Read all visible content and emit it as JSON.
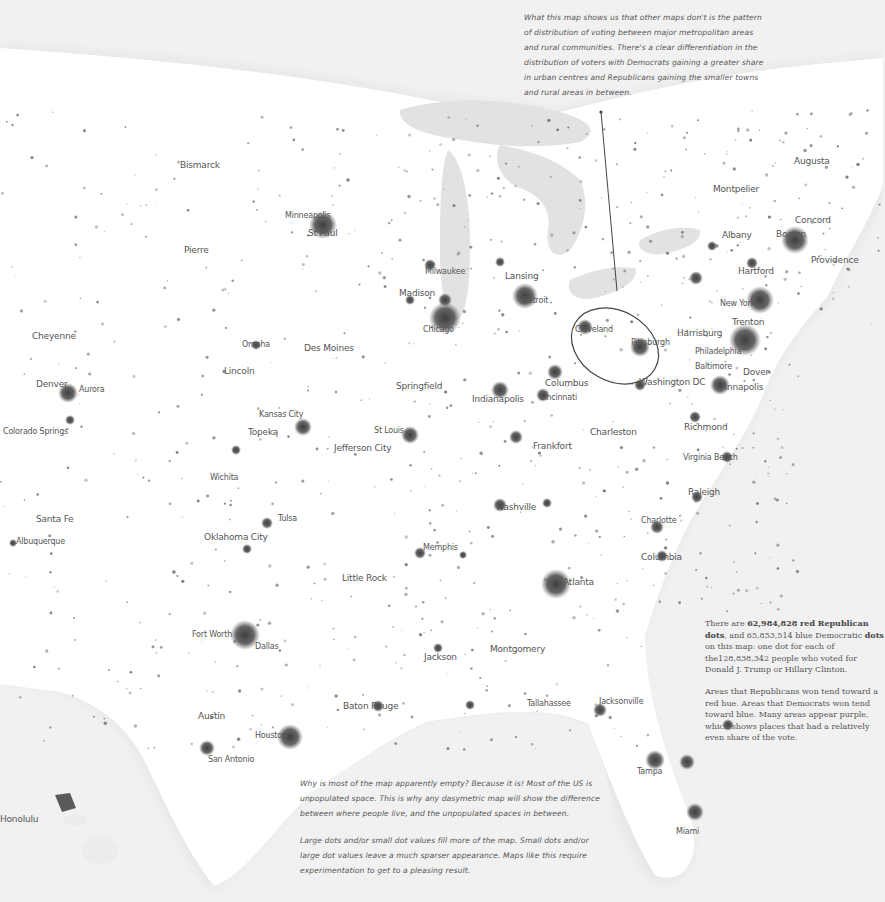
{
  "map": {
    "title": "US 2016 presidential election dot-density map",
    "colors": {
      "background": "#f1f1f1",
      "land": "#ffffff",
      "water": "#e2e2e2",
      "dots": "#4a4a4a",
      "text": "#555555"
    },
    "cities": [
      {
        "name": "Bismarck",
        "x": 180,
        "y": 160,
        "size": "m"
      },
      {
        "name": "Pierre",
        "x": 184,
        "y": 245,
        "size": "m"
      },
      {
        "name": "Minneapolis",
        "x": 285,
        "y": 211,
        "size": "s"
      },
      {
        "name": "St Paul",
        "x": 308,
        "y": 228,
        "size": "m"
      },
      {
        "name": "Cheyenne",
        "x": 32,
        "y": 331,
        "size": "m"
      },
      {
        "name": "Denver",
        "x": 36,
        "y": 379,
        "size": "m"
      },
      {
        "name": "Aurora",
        "x": 79,
        "y": 385,
        "size": "s"
      },
      {
        "name": "Colorado Springs",
        "x": 3,
        "y": 427,
        "size": "s"
      },
      {
        "name": "Santa Fe",
        "x": 36,
        "y": 514,
        "size": "m"
      },
      {
        "name": "Albuquerque",
        "x": 16,
        "y": 537,
        "size": "s"
      },
      {
        "name": "Omaha",
        "x": 242,
        "y": 340,
        "size": "s"
      },
      {
        "name": "Des Moines",
        "x": 304,
        "y": 343,
        "size": "m"
      },
      {
        "name": "Lincoln",
        "x": 224,
        "y": 366,
        "size": "m"
      },
      {
        "name": "Kansas City",
        "x": 259,
        "y": 410,
        "size": "s"
      },
      {
        "name": "Topeka",
        "x": 248,
        "y": 427,
        "size": "m"
      },
      {
        "name": "St Louis",
        "x": 374,
        "y": 426,
        "size": "s"
      },
      {
        "name": "Jefferson City",
        "x": 334,
        "y": 443,
        "size": "m"
      },
      {
        "name": "Wichita",
        "x": 210,
        "y": 473,
        "size": "s"
      },
      {
        "name": "Tulsa",
        "x": 278,
        "y": 514,
        "size": "s"
      },
      {
        "name": "Oklahoma City",
        "x": 204,
        "y": 532,
        "size": "m"
      },
      {
        "name": "Memphis",
        "x": 423,
        "y": 543,
        "size": "s"
      },
      {
        "name": "Little Rock",
        "x": 342,
        "y": 573,
        "size": "m"
      },
      {
        "name": "Fort Worth",
        "x": 192,
        "y": 630,
        "size": "s"
      },
      {
        "name": "Dallas",
        "x": 255,
        "y": 642,
        "size": "s"
      },
      {
        "name": "Jackson",
        "x": 424,
        "y": 652,
        "size": "m"
      },
      {
        "name": "Austin",
        "x": 198,
        "y": 711,
        "size": "m"
      },
      {
        "name": "Houston",
        "x": 255,
        "y": 731,
        "size": "s"
      },
      {
        "name": "San Antonio",
        "x": 208,
        "y": 755,
        "size": "s"
      },
      {
        "name": "Baton Rouge",
        "x": 343,
        "y": 701,
        "size": "m"
      },
      {
        "name": "Milwaukee",
        "x": 425,
        "y": 267,
        "size": "s"
      },
      {
        "name": "Madison",
        "x": 399,
        "y": 288,
        "size": "m"
      },
      {
        "name": "Lansing",
        "x": 505,
        "y": 271,
        "size": "m"
      },
      {
        "name": "Detroit",
        "x": 522,
        "y": 296,
        "size": "s"
      },
      {
        "name": "Chicago",
        "x": 423,
        "y": 325,
        "size": "s"
      },
      {
        "name": "Springfield",
        "x": 396,
        "y": 381,
        "size": "m"
      },
      {
        "name": "Indianapolis",
        "x": 472,
        "y": 394,
        "size": "m"
      },
      {
        "name": "Columbus",
        "x": 545,
        "y": 378,
        "size": "m"
      },
      {
        "name": "Cincinnati",
        "x": 539,
        "y": 393,
        "size": "s"
      },
      {
        "name": "Frankfort",
        "x": 533,
        "y": 441,
        "size": "m"
      },
      {
        "name": "Charleston",
        "x": 590,
        "y": 427,
        "size": "m"
      },
      {
        "name": "Nashville",
        "x": 497,
        "y": 502,
        "size": "m"
      },
      {
        "name": "Atlanta",
        "x": 563,
        "y": 577,
        "size": "m"
      },
      {
        "name": "Montgomery",
        "x": 490,
        "y": 644,
        "size": "m"
      },
      {
        "name": "Tallahassee",
        "x": 527,
        "y": 699,
        "size": "s"
      },
      {
        "name": "Jacksonville",
        "x": 599,
        "y": 697,
        "size": "s"
      },
      {
        "name": "Tampa",
        "x": 637,
        "y": 767,
        "size": "s"
      },
      {
        "name": "Miami",
        "x": 676,
        "y": 827,
        "size": "s"
      },
      {
        "name": "Cleveland",
        "x": 575,
        "y": 325,
        "size": "s"
      },
      {
        "name": "Pittsburgh",
        "x": 631,
        "y": 338,
        "size": "s"
      },
      {
        "name": "Harrisburg",
        "x": 677,
        "y": 328,
        "size": "m"
      },
      {
        "name": "Philadelphia",
        "x": 695,
        "y": 347,
        "size": "s"
      },
      {
        "name": "Baltimore",
        "x": 695,
        "y": 362,
        "size": "s"
      },
      {
        "name": "Washington DC",
        "x": 639,
        "y": 377,
        "size": "m"
      },
      {
        "name": "Dover",
        "x": 743,
        "y": 367,
        "size": "m"
      },
      {
        "name": "Annapolis",
        "x": 721,
        "y": 382,
        "size": "m"
      },
      {
        "name": "New York",
        "x": 720,
        "y": 299,
        "size": "s"
      },
      {
        "name": "Trenton",
        "x": 732,
        "y": 317,
        "size": "m"
      },
      {
        "name": "Richmond",
        "x": 684,
        "y": 422,
        "size": "m"
      },
      {
        "name": "Virginia Beach",
        "x": 683,
        "y": 453,
        "size": "s"
      },
      {
        "name": "Raleigh",
        "x": 688,
        "y": 487,
        "size": "m"
      },
      {
        "name": "Charlotte",
        "x": 641,
        "y": 516,
        "size": "s"
      },
      {
        "name": "Columbia",
        "x": 641,
        "y": 552,
        "size": "m"
      },
      {
        "name": "Augusta",
        "x": 794,
        "y": 156,
        "size": "m"
      },
      {
        "name": "Montpelier",
        "x": 713,
        "y": 184,
        "size": "m"
      },
      {
        "name": "Concord",
        "x": 795,
        "y": 215,
        "size": "m"
      },
      {
        "name": "Albany",
        "x": 722,
        "y": 230,
        "size": "m"
      },
      {
        "name": "Boston",
        "x": 776,
        "y": 229,
        "size": "m"
      },
      {
        "name": "Providence",
        "x": 811,
        "y": 255,
        "size": "m"
      },
      {
        "name": "Hartford",
        "x": 738,
        "y": 266,
        "size": "m"
      },
      {
        "name": "Honolulu",
        "x": 0,
        "y": 814,
        "size": "m"
      }
    ],
    "callout_ellipse": {
      "cx": 615,
      "cy": 346,
      "rx": 46,
      "ry": 35,
      "rotate": 30
    }
  },
  "annotations": {
    "top": [
      "What this map shows us that other maps don't is the pattern",
      "of distribution of voting between major metropolitan areas",
      "and rural communities. There's a clear differentiation in the",
      "distribution of voters with Democrats gaining a greater share",
      "in urban centres and Republicans gaining the smaller towns",
      "and rural areas in between."
    ],
    "bottom_p1": [
      "Why is most of the map apparently empty? Because it is! Most of the US is",
      "unpopulated space. This is why any dasymetric map will show the difference",
      "between where people live, and the unpopulated spaces in between."
    ],
    "bottom_p2": [
      "Large dots and/or small dot values fill more of the map. Small dots and/or",
      "large dot values leave a much sparser appearance. Maps like this require",
      "experimentation to get to a pleasing result."
    ]
  },
  "info": {
    "p1_pre": "There are ",
    "red_count": "62,984,828 red Republican dots",
    "p1_mid": ", and 65,853,514 blue Democratic ",
    "blue_tail": "dots",
    "p1_post": " on this map: one dot for each of the128,838,342 people who voted for Donald J. Trump or Hillary Clinton.",
    "p2": "Areas that Republicans won tend toward a red hue. Areas that Democrats won tend toward blue. Many areas appear purple, which shows places that had a relatively even share of the vote."
  }
}
